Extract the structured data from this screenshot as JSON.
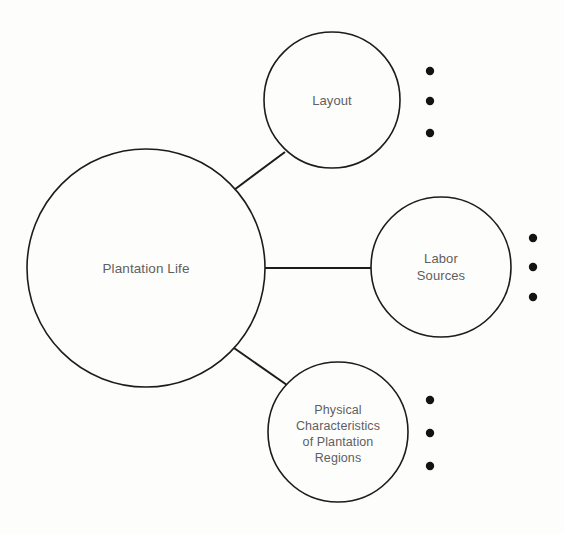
{
  "diagram": {
    "type": "concept-map",
    "title": "Plantation Life",
    "background_color": "#fdfdfc",
    "stroke_color": "#1c1c1c",
    "text_color": "#5f5f5f",
    "bullet_color": "#131313",
    "central_node": {
      "label": "Plantation Life",
      "cx": 146,
      "cy": 268,
      "r": 119
    },
    "branches": [
      {
        "id": "layout",
        "label": "Layout",
        "cx": 332,
        "cy": 100,
        "r": 68,
        "bullets": 3,
        "bullet_x": 430,
        "bullet_ys": [
          71,
          101,
          133
        ],
        "connector": {
          "x1": 234,
          "y1": 190,
          "x2": 285,
          "y2": 152
        }
      },
      {
        "id": "labor-sources",
        "label": "Labor\nSources",
        "cx": 441,
        "cy": 267,
        "r": 70,
        "bullets": 3,
        "bullet_x": 533,
        "bullet_ys": [
          238,
          267,
          297
        ],
        "connector": {
          "x1": 265,
          "y1": 268,
          "x2": 371,
          "y2": 268
        }
      },
      {
        "id": "physical-characteristics",
        "label": "Physical\nCharacteristics\nof Plantation\nRegions",
        "cx": 338,
        "cy": 432,
        "r": 70,
        "bullets": 3,
        "bullet_x": 430,
        "bullet_ys": [
          400,
          433,
          466
        ],
        "connector": {
          "x1": 234,
          "y1": 348,
          "x2": 287,
          "y2": 385
        }
      }
    ],
    "bullet_radius": 4.2
  }
}
